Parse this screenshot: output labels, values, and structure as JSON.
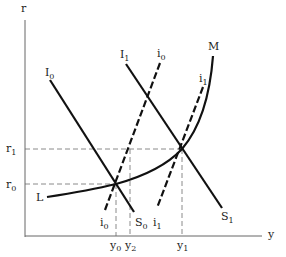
{
  "diagram": {
    "type": "IS-LM style macroeconomic diagram",
    "axes": {
      "x_label": "y",
      "y_label": "r"
    },
    "y_axis_marks": [
      {
        "base": "r",
        "sub": "1"
      },
      {
        "base": "r",
        "sub": "0"
      }
    ],
    "x_axis_marks": [
      {
        "base": "y",
        "sub": "0"
      },
      {
        "base": "y",
        "sub": "2"
      },
      {
        "base": "y",
        "sub": "1"
      }
    ],
    "curves": {
      "I0_S0": {
        "top_base": "I",
        "top_sub": "0",
        "bottom_base": "S",
        "bottom_sub": "0",
        "style": "solid"
      },
      "I1_S1": {
        "top_base": "I",
        "top_sub": "1",
        "bottom_base": "S",
        "bottom_sub": "1",
        "style": "solid"
      },
      "i0": {
        "top_base": "i",
        "top_sub": "0",
        "bottom_base": "i",
        "bottom_sub": "0",
        "style": "dashed"
      },
      "i1": {
        "top_base": "i",
        "top_sub": "1",
        "bottom_base": "i",
        "bottom_sub": "1",
        "style": "dashed"
      },
      "LM": {
        "start_label": "L",
        "end_label": "M",
        "style": "solid curve"
      }
    },
    "colors": {
      "line": "#111111",
      "guide": "#888888",
      "text": "#222222"
    }
  }
}
